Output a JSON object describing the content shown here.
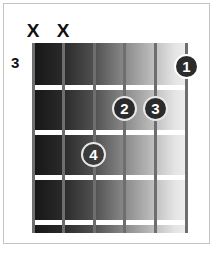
{
  "chord_diagram": {
    "start_fret": "3",
    "strings": 6,
    "frets_shown": 4,
    "muted_strings": [
      {
        "string": 6,
        "label": "X"
      },
      {
        "string": 5,
        "label": "X"
      }
    ],
    "fingers": [
      {
        "finger": "1",
        "string": 1,
        "fret": 1
      },
      {
        "finger": "2",
        "string": 3,
        "fret": 2
      },
      {
        "finger": "3",
        "string": 2,
        "fret": 2
      },
      {
        "finger": "4",
        "string": 4,
        "fret": 3
      }
    ],
    "colors": {
      "board_dark": "#151515",
      "board_light": "#eeeeee",
      "string": "#6e6e6e",
      "fret": "#ffffff",
      "dot": "#2b2b2b",
      "frame": "#c4c4c4"
    }
  }
}
